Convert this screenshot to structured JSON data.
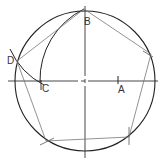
{
  "diagram": {
    "colors": {
      "circle": "#222222",
      "axis": "#333333",
      "construction": "#222222",
      "pentagon": "#777777",
      "label": "#333333"
    },
    "circle": {
      "cx": 85,
      "cy": 81,
      "r": 70
    },
    "labels": [
      {
        "id": "B",
        "text": "B",
        "x": 84,
        "y": 25
      },
      {
        "id": "A",
        "text": "A",
        "x": 118,
        "y": 93
      },
      {
        "id": "C",
        "text": "C",
        "x": 42,
        "y": 92
      },
      {
        "id": "D",
        "text": "D",
        "x": 7,
        "y": 64
      }
    ],
    "points": {
      "B": [
        84,
        9
      ],
      "A": [
        118,
        80
      ],
      "C": [
        41,
        82
      ],
      "D": [
        17,
        61
      ],
      "P2": [
        151,
        54
      ],
      "P3": [
        129,
        137
      ],
      "P4": [
        46,
        141
      ]
    }
  }
}
